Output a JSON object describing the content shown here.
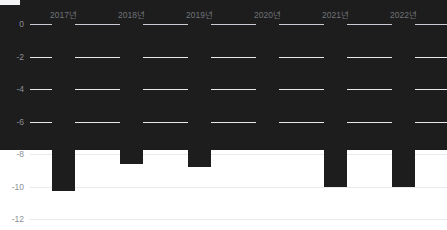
{
  "chart_data": {
    "type": "bar",
    "title": "",
    "subtitle": "",
    "xlabel": "",
    "ylabel": "",
    "categories": [
      "2017년",
      "2018년",
      "2019년",
      "2020년",
      "2021년",
      "2022년"
    ],
    "values": [
      -9.2,
      -10.3,
      -8.6,
      -8.8,
      -7.0,
      -10.0
    ],
    "series": [
      {
        "name": "",
        "values": [
          -9.2,
          -10.3,
          -8.6,
          -8.8,
          -7.0,
          -10.0
        ]
      }
    ],
    "ylim": [
      -12,
      0
    ],
    "y_ticks": [
      0,
      -2,
      -4,
      -6,
      -8,
      -10,
      -12
    ],
    "y_tick_labels": [
      "0",
      "-2",
      "-4",
      "-6",
      "-8",
      "-10",
      "-12"
    ],
    "grid": true,
    "legend": "none",
    "bar_color": "#1d1d1d",
    "gridline_color": "#e9eaee",
    "axis_color": "#c9ccd2",
    "tick_label_color": "#8c8f97",
    "category_label_color": "#6f7278"
  }
}
